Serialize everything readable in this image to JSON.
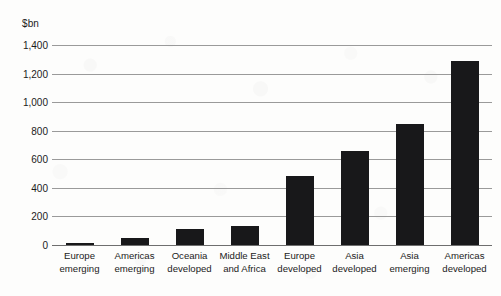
{
  "chart_data": {
    "type": "bar",
    "title": "",
    "subtitle": "",
    "unit_label": "$bn",
    "xlabel": "",
    "ylabel": "$bn",
    "ylim": [
      0,
      1400
    ],
    "grid": true,
    "legend": "none",
    "orientation": "vertical",
    "bar_color": "#18181a",
    "gridline_color": "#9a9a9a",
    "categories": [
      "Europe emerging",
      "Americas emerging",
      "Oceania developed",
      "Middle East and Africa",
      "Europe developed",
      "Asia developed",
      "Asia emerging",
      "Americas developed"
    ],
    "category_lines": [
      {
        "line1": "Europe",
        "line2": "emerging"
      },
      {
        "line1": "Americas",
        "line2": "emerging"
      },
      {
        "line1": "Oceania",
        "line2": "developed"
      },
      {
        "line1": "Middle East",
        "line2": "and Africa"
      },
      {
        "line1": "Europe",
        "line2": "developed"
      },
      {
        "line1": "Asia",
        "line2": "developed"
      },
      {
        "line1": "Asia",
        "line2": "emerging"
      },
      {
        "line1": "Americas",
        "line2": "developed"
      }
    ],
    "values": [
      10,
      50,
      110,
      135,
      480,
      660,
      850,
      1285
    ],
    "ytick_values": [
      1400,
      1200,
      1000,
      800,
      600,
      400,
      200,
      0
    ],
    "ytick_labels": [
      "1,400",
      "1,200",
      "1,000",
      "800",
      "600",
      "400",
      "200",
      "0"
    ]
  }
}
